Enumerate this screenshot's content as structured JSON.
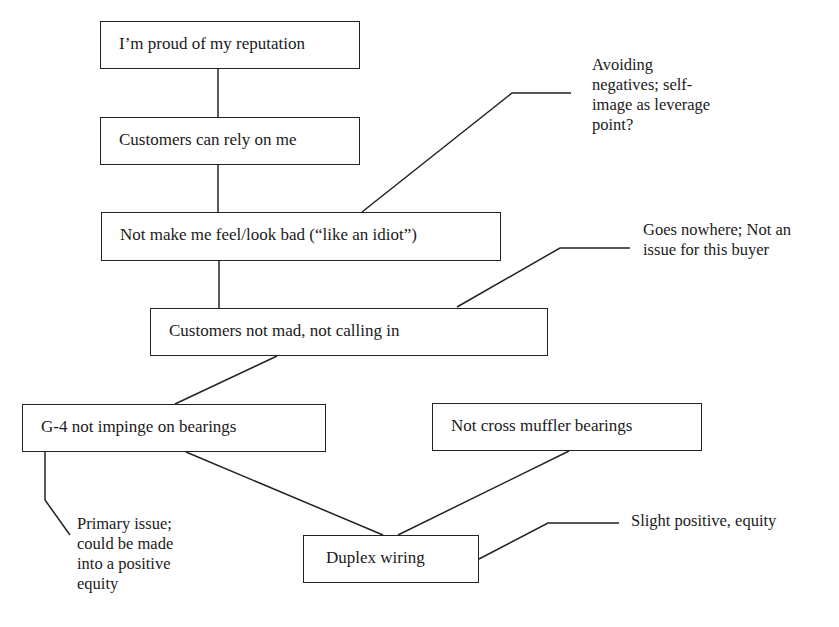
{
  "diagram": {
    "type": "laddering-hierarchy",
    "nodes": [
      {
        "id": "n1",
        "label": "I’m proud of my reputation"
      },
      {
        "id": "n2",
        "label": "Customers can rely on me"
      },
      {
        "id": "n3",
        "label": "Not make me feel/look bad (“like an idiot”)"
      },
      {
        "id": "n4",
        "label": "Customers not mad, not calling in"
      },
      {
        "id": "n5",
        "label": "G-4 not impinge on bearings"
      },
      {
        "id": "n6",
        "label": "Not cross muffler bearings"
      },
      {
        "id": "n7",
        "label": "Duplex wiring"
      }
    ],
    "edges": [
      {
        "from": "n1",
        "to": "n2"
      },
      {
        "from": "n2",
        "to": "n3"
      },
      {
        "from": "n3",
        "to": "n4"
      },
      {
        "from": "n4",
        "to": "n5"
      },
      {
        "from": "n5",
        "to": "n7"
      },
      {
        "from": "n6",
        "to": "n7"
      }
    ],
    "annotations": [
      {
        "id": "a1",
        "target": "n3",
        "lines": [
          "Avoiding",
          "negatives; self-",
          "image as leverage",
          "point?"
        ]
      },
      {
        "id": "a2",
        "target": "n4",
        "lines": [
          "Goes nowhere; Not an",
          "issue for this buyer"
        ]
      },
      {
        "id": "a3",
        "target": "n5",
        "lines": [
          "Primary issue;",
          "could be made",
          "into a positive",
          "equity"
        ]
      },
      {
        "id": "a4",
        "target": "n7",
        "lines": [
          "Slight positive, equity"
        ]
      }
    ],
    "colors": {
      "line": "#222222",
      "text": "#1a1a1a",
      "background": "#ffffff"
    }
  }
}
